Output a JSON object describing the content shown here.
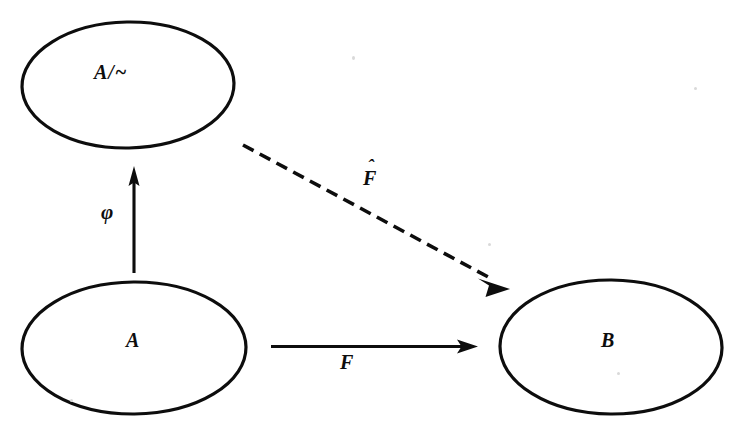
{
  "diagram": {
    "background_color": "#ffffff",
    "ink_color": "#0d0d0d",
    "nodes": [
      {
        "id": "quotient-set",
        "label": "A/~",
        "shape": "ellipse",
        "cx": 128,
        "cy": 85,
        "rx": 106,
        "ry": 63
      },
      {
        "id": "source-set",
        "label": "A",
        "shape": "ellipse",
        "cx": 134,
        "cy": 348,
        "rx": 112,
        "ry": 66
      },
      {
        "id": "target-set",
        "label": "B",
        "shape": "ellipse",
        "cx": 611,
        "cy": 347,
        "rx": 111,
        "ry": 67
      }
    ],
    "arrows": [
      {
        "id": "phi-arrow",
        "label": "φ",
        "style": "solid",
        "from": "source-set",
        "to": "quotient-set",
        "direction": "up"
      },
      {
        "id": "f-arrow",
        "label": "F",
        "style": "solid",
        "from": "source-set",
        "to": "target-set",
        "direction": "right"
      },
      {
        "id": "fhat-arrow",
        "label": "F",
        "label_accent": "ˆ",
        "style": "dashed",
        "from": "quotient-set",
        "to": "target-set",
        "direction": "diagonal-down-right"
      }
    ]
  }
}
